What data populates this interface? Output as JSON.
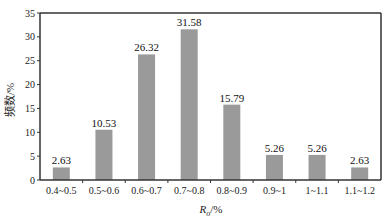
{
  "chart_data": {
    "type": "bar",
    "title": "",
    "xlabel": "R_o/%",
    "xlabel_main": "R",
    "xlabel_sub": "o",
    "xlabel_unit": "/%",
    "ylabel": "频数/%",
    "ylim": [
      0,
      35
    ],
    "yticks": [
      0,
      5,
      10,
      15,
      20,
      25,
      30,
      35
    ],
    "grid": false,
    "legend": null,
    "categories": [
      "0.4~0.5",
      "0.5~0.6",
      "0.6~0.7",
      "0.7~0.8",
      "0.8~0.9",
      "0.9~1",
      "1~1.1",
      "1.1~1.2"
    ],
    "values": [
      2.63,
      10.53,
      26.32,
      31.58,
      15.79,
      5.26,
      5.26,
      2.63
    ],
    "value_labels": [
      "2.63",
      "10.53",
      "26.32",
      "31.58",
      "15.79",
      "5.26",
      "5.26",
      "2.63"
    ],
    "bar_color": "#9a9a9a",
    "axis_color": "#333333"
  }
}
